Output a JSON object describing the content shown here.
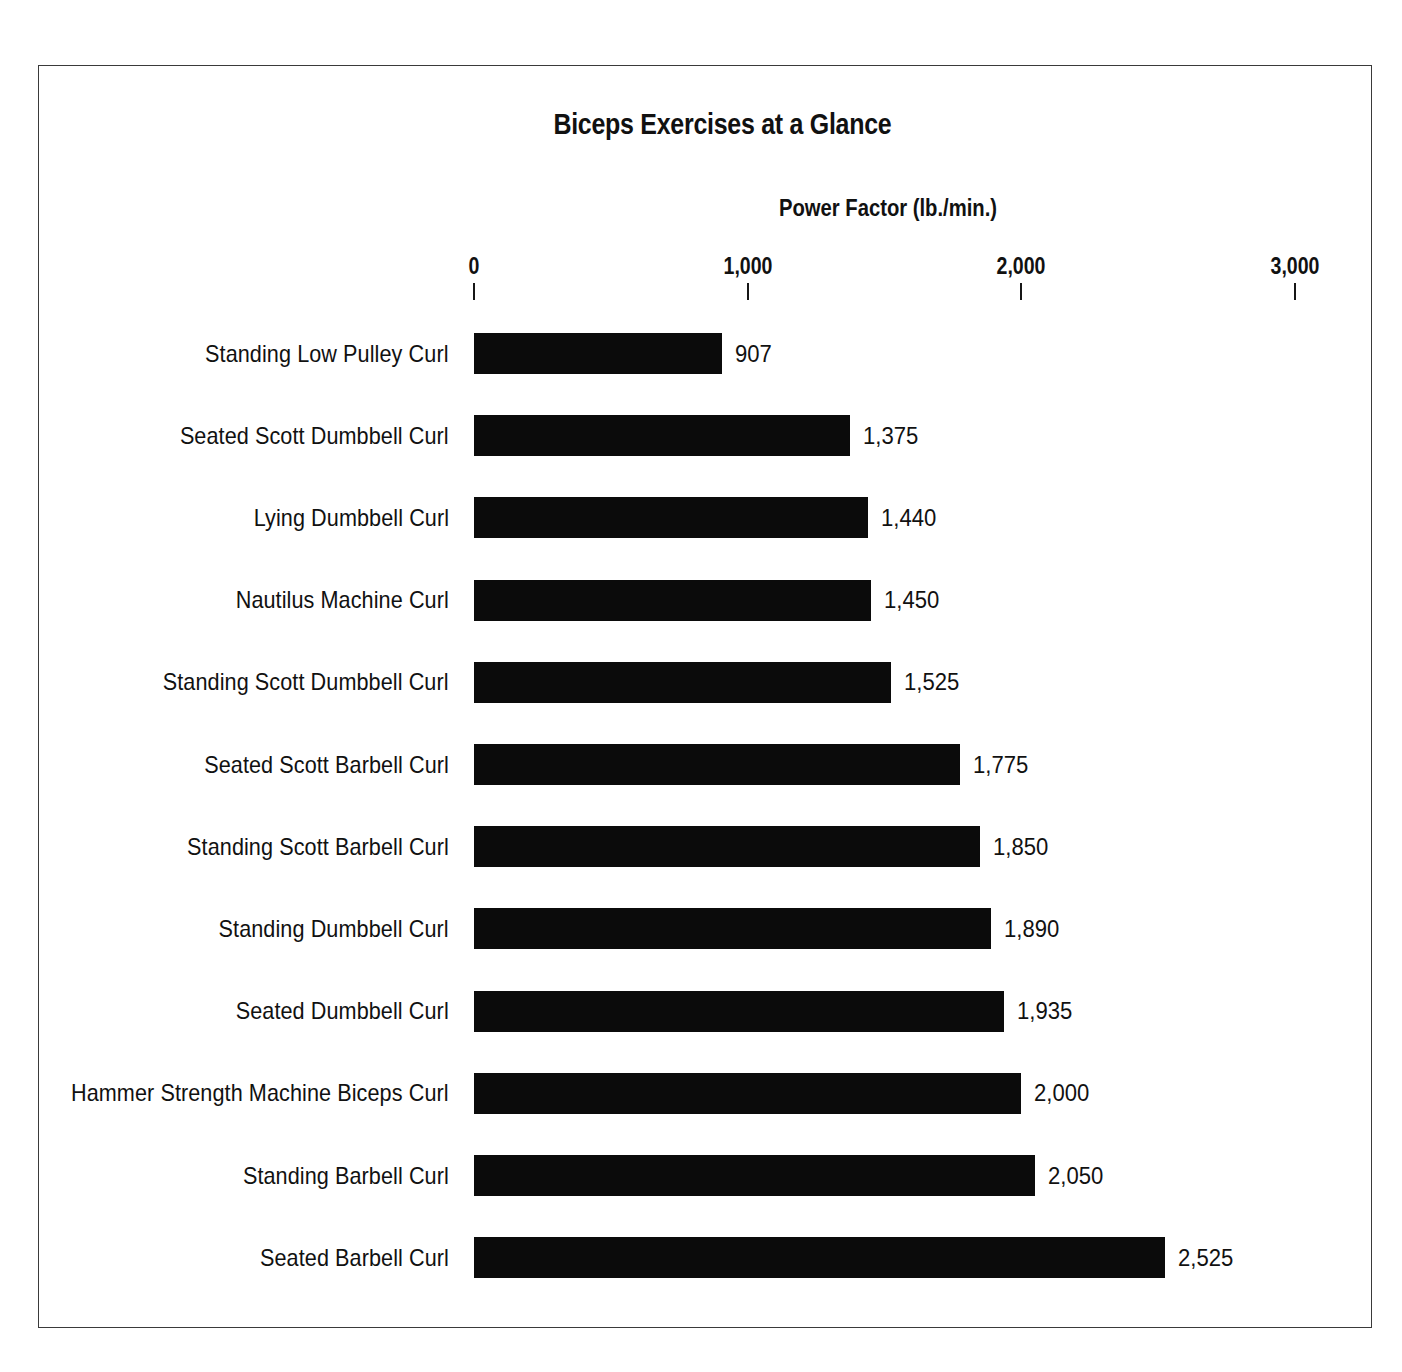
{
  "chart_data": {
    "type": "bar",
    "orientation": "horizontal",
    "title": "Biceps Exercises at a Glance",
    "xlabel": "Power Factor (lb./min.)",
    "ylabel": "",
    "xlim": [
      0,
      3000
    ],
    "xticks": [
      0,
      1000,
      2000,
      3000
    ],
    "xtick_labels": [
      "0",
      "1,000",
      "2,000",
      "3,000"
    ],
    "grid": false,
    "legend": null,
    "bar_color": "#0b0b0b",
    "value_labels_shown": true,
    "categories": [
      "Standing Low Pulley Curl",
      "Seated Scott Dumbbell Curl",
      "Lying Dumbbell Curl",
      "Nautilus Machine Curl",
      "Standing Scott Dumbbell Curl",
      "Seated Scott Barbell Curl",
      "Standing Scott Barbell Curl",
      "Standing Dumbbell Curl",
      "Seated Dumbbell Curl",
      "Hammer Strength Machine Biceps Curl",
      "Standing Barbell Curl",
      "Seated Barbell Curl"
    ],
    "values": [
      907,
      1375,
      1440,
      1450,
      1525,
      1775,
      1850,
      1890,
      1935,
      2000,
      2050,
      2525
    ],
    "value_labels": [
      "907",
      "1,375",
      "1,440",
      "1,450",
      "1,525",
      "1,775",
      "1,850",
      "1,890",
      "1,935",
      "2,000",
      "2,050",
      "2,525"
    ]
  },
  "layout": {
    "plot_left_px": 474,
    "px_per_1000": 273.7,
    "first_row_top_px": 333,
    "row_pitch_px": 82.2,
    "bar_height_px": 41,
    "value_label_gap_px": 13
  }
}
